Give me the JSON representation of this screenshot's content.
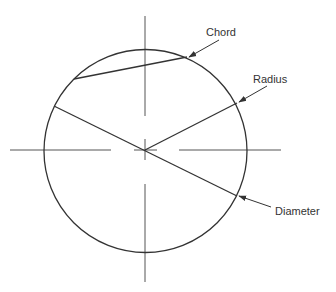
{
  "diagram": {
    "labels": {
      "chord": "Chord",
      "radius": "Radius",
      "diameter": "Diameter"
    },
    "colors": {
      "stroke": "#333333",
      "axis": "#555555",
      "background": "#ffffff"
    }
  }
}
